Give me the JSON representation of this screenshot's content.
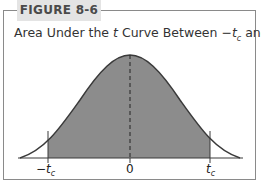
{
  "figure": {
    "label": "FIGURE 8-6",
    "title_parts": {
      "prefix": "Area Under the ",
      "t": "t",
      "middle": " Curve Between −",
      "tc1": "t",
      "sub1": "c",
      "and": " and ",
      "tc2": "t",
      "sub2": "c"
    }
  },
  "axis": {
    "left_label_minus": "−",
    "left_label_t": "t",
    "left_label_sub": "c",
    "center_label": "0",
    "right_label_t": "t",
    "right_label_sub": "c"
  },
  "colors": {
    "shade": "#8c8c8c",
    "curve": "#3a3a3a",
    "border": "#8a8a8a",
    "tab_bg": "#e4e4e4"
  }
}
